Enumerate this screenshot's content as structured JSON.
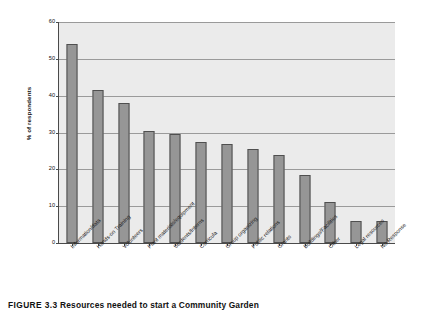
{
  "chart_data": {
    "type": "bar",
    "title": "",
    "xlabel": "",
    "ylabel": "% of respondents",
    "ylim": [
      0,
      60
    ],
    "ytick_values": [
      0,
      10,
      20,
      30,
      40,
      50,
      60
    ],
    "ytick_labels": [
      "0",
      "10",
      "20",
      "30",
      "40",
      "50",
      "60"
    ],
    "grid": true,
    "legend": "none",
    "categories": [
      "Information/data",
      "Hands-on Training",
      "Volunteers",
      "Plant materials/equipment",
      "Students/Interns",
      "Curricula",
      "Group organizing",
      "Public relations",
      "Grants",
      "Buildings/Facilities",
      "Other",
      "Legal resources",
      "No Response"
    ],
    "values": [
      54,
      41.5,
      38,
      30.5,
      29.5,
      27.5,
      27,
      25.5,
      24,
      18.5,
      11,
      6,
      6
    ],
    "bar_color": "#969696",
    "bar_edge_color": "#4f4f4f",
    "plot_background": "#ebebeb",
    "gridline_color": "#9a9a9a",
    "axis_color": "#4a4a4a"
  },
  "caption": {
    "number": "FIGURE 3.3",
    "text": "Resources needed to start a Community Garden"
  }
}
